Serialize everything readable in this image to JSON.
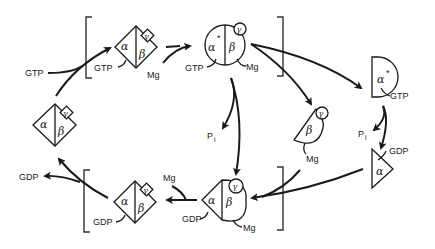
{
  "diagram": {
    "title": "",
    "subunits": {
      "alpha": "α",
      "beta": "β",
      "gamma": "γ",
      "alpha_active": "α",
      "star": "*"
    },
    "labels": {
      "gtp_in": "GTP",
      "gtp_bound_1": "GTP",
      "mg_1": "Mg",
      "gtp_bound_2": "GTP",
      "mg_2": "Mg",
      "gtp_alpha": "GTP",
      "pi_1": "P",
      "pi_1_sub": "i",
      "pi_2": "P",
      "pi_2_sub": "i",
      "gdp_alpha": "GDP",
      "mg_beta": "Mg",
      "mg_3": "Mg",
      "gdp_bound_1": "GDP",
      "mg_4": "Mg",
      "gdp_bound_2": "GDP",
      "gdp_out": "GDP"
    },
    "nodes": [
      {
        "id": "heterotrimer-gdp-free",
        "desc": "αβγ diamond (empty)"
      },
      {
        "id": "heterotrimer-gtp-mg",
        "desc": "αβγ diamond with GTP and Mg"
      },
      {
        "id": "active-heterotrimer",
        "desc": "α*βγ circle with GTP and Mg"
      },
      {
        "id": "alpha-gtp",
        "desc": "α* half-circle with GTP"
      },
      {
        "id": "beta-gamma-mg",
        "desc": "βγ with Mg"
      },
      {
        "id": "alpha-gdp",
        "desc": "α triangle with GDP"
      },
      {
        "id": "heterotrimer-gdp-mg",
        "desc": "αβγ with GDP and Mg"
      },
      {
        "id": "heterotrimer-gdp",
        "desc": "αβγ diamond with GDP"
      }
    ]
  }
}
